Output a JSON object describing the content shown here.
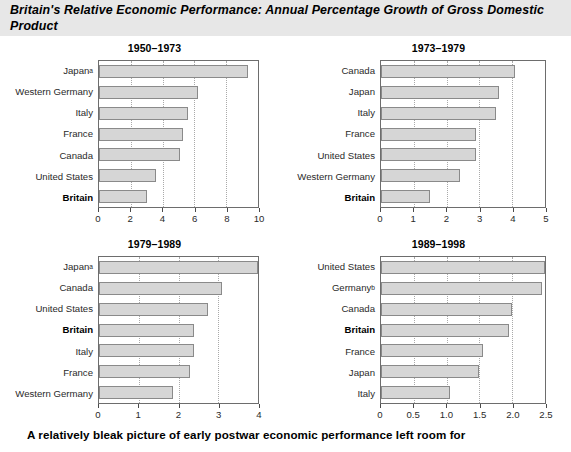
{
  "header": {
    "title": "Britain's Relative Economic Performance: Annual Percentage Growth of Gross Domestic Product"
  },
  "caption": {
    "text": "A relatively bleak picture of early postwar economic performance left room for"
  },
  "chart_data": [
    {
      "type": "bar",
      "orientation": "horizontal",
      "title": "1950–1973",
      "xlabel": "",
      "ylabel": "",
      "xlim": [
        0,
        10
      ],
      "ticks": [
        0,
        2,
        4,
        6,
        8,
        10
      ],
      "tick_labels": [
        "0",
        "2",
        "4",
        "6",
        "8",
        "10"
      ],
      "grid": true,
      "legend": "none",
      "categories": [
        "Japan",
        "Western Germany",
        "Italy",
        "France",
        "Canada",
        "United States",
        "Britain"
      ],
      "category_marks": [
        "a",
        "",
        "",
        "",
        "",
        "",
        ""
      ],
      "highlight": "Britain",
      "values": [
        9.4,
        6.2,
        5.6,
        5.3,
        5.1,
        3.6,
        3.0
      ]
    },
    {
      "type": "bar",
      "orientation": "horizontal",
      "title": "1973–1979",
      "xlabel": "",
      "ylabel": "",
      "xlim": [
        0,
        5
      ],
      "ticks": [
        0,
        1,
        2,
        3,
        4,
        5
      ],
      "tick_labels": [
        "0",
        "1",
        "2",
        "3",
        "4",
        "5"
      ],
      "grid": true,
      "legend": "none",
      "categories": [
        "Canada",
        "Japan",
        "Italy",
        "France",
        "United States",
        "Western Germany",
        "Britain"
      ],
      "category_marks": [
        "",
        "",
        "",
        "",
        "",
        "",
        ""
      ],
      "highlight": "Britain",
      "values": [
        4.1,
        3.6,
        3.5,
        2.9,
        2.9,
        2.4,
        1.5
      ]
    },
    {
      "type": "bar",
      "orientation": "horizontal",
      "title": "1979–1989",
      "xlabel": "",
      "ylabel": "",
      "xlim": [
        0,
        4
      ],
      "ticks": [
        0,
        1,
        2,
        3,
        4
      ],
      "tick_labels": [
        "0",
        "1",
        "2",
        "3",
        "4"
      ],
      "grid": true,
      "legend": "none",
      "categories": [
        "Japan",
        "Canada",
        "United States",
        "Britain",
        "Italy",
        "France",
        "Western Germany"
      ],
      "category_marks": [
        "a",
        "",
        "",
        "",
        "",
        "",
        ""
      ],
      "highlight": "Britain",
      "values": [
        4.0,
        3.1,
        2.75,
        2.4,
        2.4,
        2.3,
        1.85
      ]
    },
    {
      "type": "bar",
      "orientation": "horizontal",
      "title": "1989–1998",
      "xlabel": "",
      "ylabel": "",
      "xlim": [
        0,
        2.5
      ],
      "ticks": [
        0,
        0.5,
        1.0,
        1.5,
        2.0,
        2.5
      ],
      "tick_labels": [
        "0",
        "0.5",
        "1.0",
        "1.5",
        "2.0",
        "2.5"
      ],
      "grid": true,
      "legend": "none",
      "categories": [
        "United States",
        "Germany",
        "Canada",
        "Britain",
        "France",
        "Japan",
        "Italy"
      ],
      "category_marks": [
        "",
        "b",
        "",
        "",
        "",
        "",
        ""
      ],
      "highlight": "Britain",
      "values": [
        2.5,
        2.45,
        2.0,
        1.95,
        1.55,
        1.5,
        1.05
      ]
    }
  ],
  "style": {
    "bar_fill": "#d6d6d6",
    "bar_stroke": "#8a8a8a",
    "axis_color": "#6d6d6d",
    "grid_color": "#a9a9a9",
    "header_band": "#e7e7e7"
  }
}
